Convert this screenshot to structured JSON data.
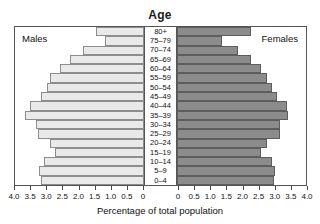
{
  "clipped_header": "",
  "chart": {
    "title": "Age",
    "xlabel": "Percentage of total population",
    "legend_left": "Males",
    "legend_right": "Females"
  },
  "chart_data": {
    "type": "bar",
    "subtype": "population-pyramid",
    "title": "Age",
    "xlabel": "Percentage of total population",
    "ylabel": "Age",
    "orientation": "horizontal",
    "grid": false,
    "legend_position": "inside-top-corners",
    "axis_left": {
      "label": "Males",
      "ticks": [
        "4.0",
        "3.5",
        "3.0",
        "2.5",
        "2.0",
        "1.5",
        "1.0",
        "0.5",
        "0"
      ],
      "tick_values": [
        4.0,
        3.5,
        3.0,
        2.5,
        2.0,
        1.5,
        1.0,
        0.5,
        0
      ],
      "range": [
        4.0,
        0
      ],
      "direction": "reversed"
    },
    "axis_right": {
      "label": "Females",
      "ticks": [
        "0",
        "0.5",
        "1.0",
        "1.5",
        "2.0",
        "2.5",
        "3.0",
        "3.5",
        "4.0"
      ],
      "tick_values": [
        0,
        0.5,
        1.0,
        1.5,
        2.0,
        2.5,
        3.0,
        3.5,
        4.0
      ],
      "range": [
        0,
        4.0
      ],
      "direction": "normal"
    },
    "categories": [
      "80+",
      "75–79",
      "70–74",
      "65–69",
      "60–64",
      "55–59",
      "50–54",
      "45–49",
      "40–44",
      "35–39",
      "30–34",
      "25–29",
      "20–24",
      "15–19",
      "10–14",
      "5–9",
      "0–4"
    ],
    "series": [
      {
        "name": "Males",
        "color": "#e9e9e9",
        "values": [
          1.5,
          1.2,
          1.9,
          2.3,
          2.6,
          2.9,
          3.0,
          3.2,
          3.55,
          3.7,
          3.35,
          3.3,
          2.9,
          2.75,
          3.1,
          3.25,
          3.2
        ]
      },
      {
        "name": "Females",
        "color": "#8c8c8c",
        "values": [
          2.3,
          1.4,
          1.9,
          2.3,
          2.6,
          2.8,
          2.95,
          3.1,
          3.4,
          3.45,
          3.2,
          3.2,
          2.8,
          2.6,
          2.95,
          3.05,
          3.0
        ]
      }
    ]
  },
  "colors": {
    "male_bar": "#e9e9e9",
    "female_bar": "#8c8c8c",
    "border": "#555555",
    "text": "#111111",
    "background": "#ffffff"
  }
}
